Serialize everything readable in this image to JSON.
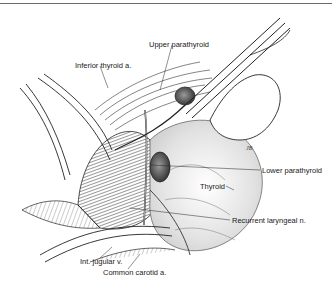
{
  "figure": {
    "artist_signature": "JB",
    "labels": [
      {
        "id": "upper-parathyroid",
        "text": "Upper parathyroid",
        "x": 149,
        "y": 41
      },
      {
        "id": "inferior-thyroid-artery",
        "text": "Inferior thyroid a.",
        "x": 75,
        "y": 62
      },
      {
        "id": "lower-parathyroid",
        "text": "Lower parathyroid",
        "x": 262,
        "y": 167
      },
      {
        "id": "thyroid",
        "text": "Thyroid",
        "x": 200,
        "y": 185
      },
      {
        "id": "recurrent-laryngeal-nerve",
        "text": "Recurrent laryngeal n.",
        "x": 232,
        "y": 217
      },
      {
        "id": "internal-jugular-vein",
        "text": "Int. jugular v.",
        "x": 80,
        "y": 260
      },
      {
        "id": "common-carotid-artery",
        "text": "Common carotid a.",
        "x": 103,
        "y": 271
      }
    ]
  }
}
